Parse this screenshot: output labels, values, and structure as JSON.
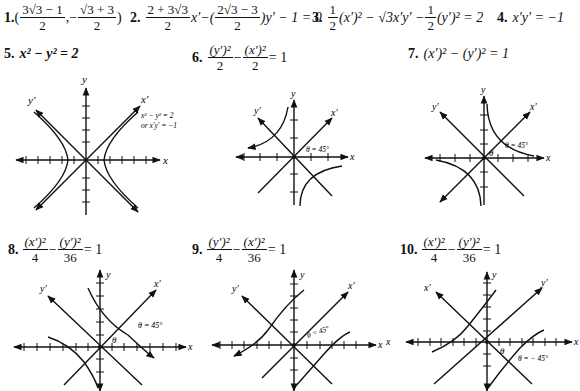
{
  "problems": [
    {
      "number": "1.",
      "answer": "((3√3 − 1)/2, −(√3 + 3)/2)",
      "parts": {
        "n1": "3√3 − 1",
        "d1": "2",
        "n2": "√3 + 3",
        "d2": "2"
      }
    },
    {
      "number": "2.",
      "answer": "(2 + 3√3)/2 x′ − ((2√3 − 3)/2) y′ − 1 = 0",
      "parts": {
        "n1": "2 + 3√3",
        "d1": "2",
        "mid": "x′−(",
        "n2": "2√3 − 3",
        "d2": "2",
        "tail": ")y′ − 1 = 0"
      }
    },
    {
      "number": "3.",
      "answer": "1/2 (x′)² − √3 x′y′ − 1/2 (y′)² = 2",
      "parts": {
        "n1": "1",
        "d1": "2",
        "mid": "(x′)² − √3x′y′ −",
        "n2": "1",
        "d2": "2",
        "tail": "(y′)² = 2"
      }
    },
    {
      "number": "4.",
      "answer": "x′y′ = −1"
    },
    {
      "number": "5.",
      "answer": "x² − y² = 2",
      "graph": {
        "axes": [
          "x",
          "y"
        ],
        "rotated_axes": [
          "x′",
          "y′"
        ],
        "annotation_line1": "x² − y² = 2",
        "annotation_line2": "or x′y′ = −1"
      }
    },
    {
      "number": "6.",
      "answer": "(y′)²/2 − (x′)²/2 = 1",
      "parts": {
        "n1": "(y′)²",
        "d1": "2",
        "n2": "(x′)²",
        "d2": "2",
        "tail": "= 1"
      },
      "graph": {
        "axes": [
          "x",
          "y"
        ],
        "rotated_axes": [
          "x′",
          "y′"
        ],
        "angle_label": "θ = 45°"
      }
    },
    {
      "number": "7.",
      "answer": "(x′)² − (y′)² = 1",
      "graph": {
        "axes": [
          "x",
          "y"
        ],
        "rotated_axes": [
          "x′",
          "y′"
        ],
        "angle_label": "θ = 45°",
        "theta": "θ"
      }
    },
    {
      "number": "8.",
      "answer": "(x′)²/4 − (y′)²/36 = 1",
      "parts": {
        "n1": "(x′)²",
        "d1": "4",
        "n2": "(y′)²",
        "d2": "36",
        "tail": "= 1"
      },
      "graph": {
        "axes": [
          "x",
          "y"
        ],
        "rotated_axes": [
          "x′",
          "y′"
        ],
        "angle_label": "θ = 45°",
        "theta": "θ"
      }
    },
    {
      "number": "9.",
      "answer": "(y′)²/4 − (x′)²/36 = 1",
      "parts": {
        "n1": "(y′)²",
        "d1": "4",
        "n2": "(x′)²",
        "d2": "36",
        "tail": "= 1"
      },
      "graph": {
        "axes": [
          "x",
          "y"
        ],
        "rotated_axes": [
          "x′",
          "y′"
        ],
        "angle_label": "θ = 45°"
      }
    },
    {
      "number": "10.",
      "answer": "(x′)²/4 − (y′)²/36 = 1",
      "parts": {
        "n1": "(x′)²",
        "d1": "4",
        "n2": "(y′)²",
        "d2": "36",
        "tail": "= 1"
      },
      "graph": {
        "axes": [
          "x",
          "y"
        ],
        "rotated_axes": [
          "x′",
          "y′"
        ],
        "angle_label": "θ = − 45°",
        "theta": "θ"
      }
    }
  ],
  "text": {
    "p1_open": "(",
    "p1_comma": ",−",
    "p1_close": ")",
    "p4_eq": "x′y′ = −1",
    "p5_eq": "x² − y² = 2",
    "p7_eq": "(x′)² − (y′)² = 1",
    "minus": "−"
  }
}
